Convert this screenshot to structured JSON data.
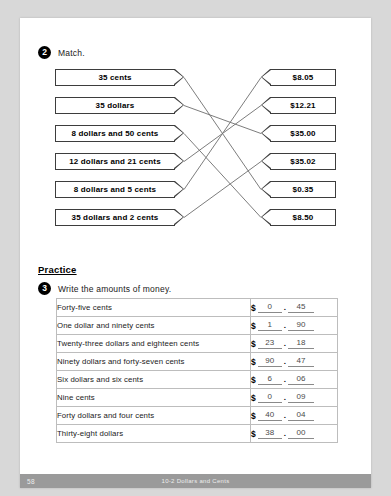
{
  "exercise_2": {
    "number": "2",
    "instruction": "Match.",
    "left_items": [
      {
        "label": "35 cents"
      },
      {
        "label": "35 dollars"
      },
      {
        "label": "8 dollars and 50 cents"
      },
      {
        "label": "12 dollars and 21 cents"
      },
      {
        "label": "8 dollars and 5 cents"
      },
      {
        "label": "35 dollars and 2 cents"
      }
    ],
    "right_items": [
      {
        "label": "$8.05"
      },
      {
        "label": "$12.21"
      },
      {
        "label": "$35.00"
      },
      {
        "label": "$35.02"
      },
      {
        "label": "$0.35"
      },
      {
        "label": "$8.50"
      }
    ],
    "connections": [
      {
        "from": 0,
        "to": 4
      },
      {
        "from": 1,
        "to": 2
      },
      {
        "from": 2,
        "to": 5
      },
      {
        "from": 3,
        "to": 1
      },
      {
        "from": 4,
        "to": 0
      },
      {
        "from": 5,
        "to": 3
      }
    ]
  },
  "practice": {
    "heading": "Practice",
    "exercise_3": {
      "number": "3",
      "instruction": "Write the amounts of money."
    },
    "rows": [
      {
        "phrase": "Forty-five cents",
        "sign": "$",
        "dollars": "0",
        "separator": ".",
        "cents": "45"
      },
      {
        "phrase": "One dollar and ninety cents",
        "sign": "$",
        "dollars": "1",
        "separator": ".",
        "cents": "90"
      },
      {
        "phrase": "Twenty-three dollars and eighteen cents",
        "sign": "$",
        "dollars": "23",
        "separator": ".",
        "cents": "18"
      },
      {
        "phrase": "Ninety dollars and forty-seven cents",
        "sign": "$",
        "dollars": "90",
        "separator": ".",
        "cents": "47"
      },
      {
        "phrase": "Six dollars and six cents",
        "sign": "$",
        "dollars": "6",
        "separator": ".",
        "cents": "06"
      },
      {
        "phrase": "Nine cents",
        "sign": "$",
        "dollars": "0",
        "separator": ".",
        "cents": "09"
      },
      {
        "phrase": "Forty dollars and four cents",
        "sign": "$",
        "dollars": "40",
        "separator": ".",
        "cents": "04"
      },
      {
        "phrase": "Thirty-eight dollars",
        "sign": "$",
        "dollars": "38",
        "separator": ".",
        "cents": "00"
      }
    ]
  },
  "footer": {
    "page_number": "58",
    "title": "10-2  Dollars and Cents"
  },
  "colors": {
    "page_background": "#ffffff",
    "outer_background": "#d8d8d8",
    "box_border": "#3d3d3d",
    "table_border": "#bdbdbd",
    "footer_background": "#9a9a9a",
    "line": "#6e6e6e"
  }
}
